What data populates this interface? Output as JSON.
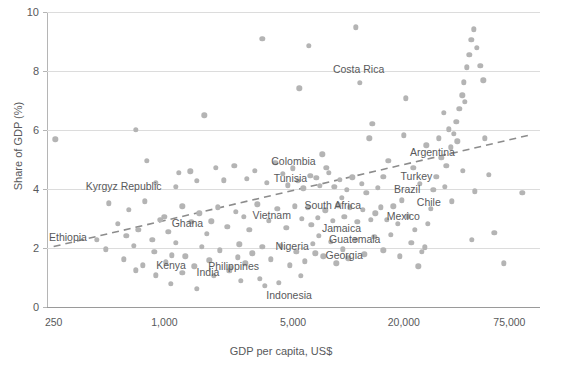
{
  "chart_data": {
    "type": "scatter",
    "title": "",
    "xlabel": "GDP per capita, US$",
    "ylabel": "Share of GDP (%)",
    "xscale": "log",
    "xlim": [
      230,
      110000
    ],
    "ylim": [
      0,
      10
    ],
    "xticks": [
      250,
      1000,
      5000,
      20000,
      75000
    ],
    "xticklabels": [
      "250",
      "1,000",
      "5,000",
      "20,000",
      "75,000"
    ],
    "yticks": [
      0,
      2,
      4,
      6,
      8,
      10
    ],
    "yticklabels": [
      "0",
      "2",
      "4",
      "6",
      "8",
      "10"
    ],
    "grid": "horizontal",
    "legend": "none",
    "point_color": "#b4b4b4",
    "trendline": {
      "style": "dashed",
      "color": "#8c8c8c",
      "x_start": 250,
      "y_start": 2.05,
      "x_end": 100000,
      "y_end": 5.85
    },
    "labeled_points": [
      {
        "name": "Costa Rica",
        "x": 11500,
        "y": 7.6
      },
      {
        "name": "Argentina",
        "x": 16500,
        "y": 4.95
      },
      {
        "name": "Turkey",
        "x": 15500,
        "y": 4.42
      },
      {
        "name": "Brazil",
        "x": 14500,
        "y": 4.05
      },
      {
        "name": "Colombia",
        "x": 7600,
        "y": 4.72
      },
      {
        "name": "Tunisia",
        "x": 6700,
        "y": 4.38
      },
      {
        "name": "South Africa",
        "x": 9200,
        "y": 3.7
      },
      {
        "name": "Chile",
        "x": 19500,
        "y": 3.62
      },
      {
        "name": "Mexico",
        "x": 14000,
        "y": 3.18
      },
      {
        "name": "Kyrgyz Republic",
        "x": 1150,
        "y": 4.08
      },
      {
        "name": "Vietnam",
        "x": 2700,
        "y": 3.05
      },
      {
        "name": "Ghana",
        "x": 1800,
        "y": 2.9
      },
      {
        "name": "Jamaica",
        "x": 6300,
        "y": 2.78
      },
      {
        "name": "Guatemala",
        "x": 6900,
        "y": 2.42
      },
      {
        "name": "Ethiopia",
        "x": 430,
        "y": 2.28
      },
      {
        "name": "Nigeria",
        "x": 3400,
        "y": 2.05
      },
      {
        "name": "Georgia",
        "x": 6600,
        "y": 1.82
      },
      {
        "name": "Kenya",
        "x": 1100,
        "y": 1.75
      },
      {
        "name": "Philippines",
        "x": 2500,
        "y": 1.68
      },
      {
        "name": "India",
        "x": 2300,
        "y": 1.32
      },
      {
        "name": "Indonesia",
        "x": 4200,
        "y": 0.82
      }
    ],
    "points": [
      {
        "x": 255,
        "y": 5.68
      },
      {
        "x": 700,
        "y": 6.0
      },
      {
        "x": 1650,
        "y": 6.5
      },
      {
        "x": 3400,
        "y": 9.1
      },
      {
        "x": 6100,
        "y": 8.85
      },
      {
        "x": 5400,
        "y": 7.42
      },
      {
        "x": 13500,
        "y": 6.22
      },
      {
        "x": 13000,
        "y": 5.72
      },
      {
        "x": 20500,
        "y": 7.08
      },
      {
        "x": 20000,
        "y": 5.82
      },
      {
        "x": 800,
        "y": 4.95
      },
      {
        "x": 7200,
        "y": 5.18
      },
      {
        "x": 11000,
        "y": 9.48
      },
      {
        "x": 900,
        "y": 4.22
      },
      {
        "x": 500,
        "y": 3.52
      },
      {
        "x": 640,
        "y": 3.3
      },
      {
        "x": 780,
        "y": 3.58
      },
      {
        "x": 1000,
        "y": 3.05
      },
      {
        "x": 1200,
        "y": 4.55
      },
      {
        "x": 1380,
        "y": 4.6
      },
      {
        "x": 1500,
        "y": 4.28
      },
      {
        "x": 1900,
        "y": 4.72
      },
      {
        "x": 2100,
        "y": 4.3
      },
      {
        "x": 2400,
        "y": 4.78
      },
      {
        "x": 2800,
        "y": 4.35
      },
      {
        "x": 3100,
        "y": 4.62
      },
      {
        "x": 3600,
        "y": 4.22
      },
      {
        "x": 4000,
        "y": 4.88
      },
      {
        "x": 4400,
        "y": 4.52
      },
      {
        "x": 4700,
        "y": 4.12
      },
      {
        "x": 5000,
        "y": 4.7
      },
      {
        "x": 5300,
        "y": 4.28
      },
      {
        "x": 5700,
        "y": 4.02
      },
      {
        "x": 6200,
        "y": 4.44
      },
      {
        "x": 7000,
        "y": 4.1
      },
      {
        "x": 7800,
        "y": 4.55
      },
      {
        "x": 8400,
        "y": 4.08
      },
      {
        "x": 9000,
        "y": 4.32
      },
      {
        "x": 9800,
        "y": 3.98
      },
      {
        "x": 10500,
        "y": 4.4
      },
      {
        "x": 11800,
        "y": 4.18
      },
      {
        "x": 12500,
        "y": 3.88
      },
      {
        "x": 560,
        "y": 2.82
      },
      {
        "x": 620,
        "y": 2.42
      },
      {
        "x": 720,
        "y": 2.62
      },
      {
        "x": 860,
        "y": 2.28
      },
      {
        "x": 950,
        "y": 2.95
      },
      {
        "x": 1050,
        "y": 2.55
      },
      {
        "x": 1250,
        "y": 3.42
      },
      {
        "x": 1400,
        "y": 2.88
      },
      {
        "x": 1550,
        "y": 3.18
      },
      {
        "x": 1700,
        "y": 2.48
      },
      {
        "x": 1950,
        "y": 3.38
      },
      {
        "x": 2200,
        "y": 2.72
      },
      {
        "x": 2450,
        "y": 3.22
      },
      {
        "x": 2900,
        "y": 2.62
      },
      {
        "x": 3200,
        "y": 3.48
      },
      {
        "x": 3700,
        "y": 2.92
      },
      {
        "x": 4100,
        "y": 3.32
      },
      {
        "x": 4600,
        "y": 2.68
      },
      {
        "x": 5100,
        "y": 3.42
      },
      {
        "x": 5600,
        "y": 2.98
      },
      {
        "x": 6000,
        "y": 3.38
      },
      {
        "x": 6800,
        "y": 3.02
      },
      {
        "x": 7500,
        "y": 3.28
      },
      {
        "x": 8200,
        "y": 2.92
      },
      {
        "x": 8800,
        "y": 3.45
      },
      {
        "x": 9500,
        "y": 3.05
      },
      {
        "x": 10200,
        "y": 3.38
      },
      {
        "x": 11200,
        "y": 2.88
      },
      {
        "x": 12000,
        "y": 3.3
      },
      {
        "x": 13200,
        "y": 2.95
      },
      {
        "x": 15000,
        "y": 3.38
      },
      {
        "x": 16200,
        "y": 2.95
      },
      {
        "x": 17500,
        "y": 3.42
      },
      {
        "x": 18500,
        "y": 2.82
      },
      {
        "x": 21000,
        "y": 3.08
      },
      {
        "x": 23000,
        "y": 2.62
      },
      {
        "x": 480,
        "y": 1.95
      },
      {
        "x": 600,
        "y": 1.62
      },
      {
        "x": 680,
        "y": 2.08
      },
      {
        "x": 760,
        "y": 1.42
      },
      {
        "x": 880,
        "y": 1.88
      },
      {
        "x": 1020,
        "y": 1.52
      },
      {
        "x": 1150,
        "y": 2.18
      },
      {
        "x": 1300,
        "y": 1.72
      },
      {
        "x": 1450,
        "y": 1.38
      },
      {
        "x": 1600,
        "y": 2.05
      },
      {
        "x": 1750,
        "y": 1.58
      },
      {
        "x": 2000,
        "y": 1.92
      },
      {
        "x": 2250,
        "y": 1.22
      },
      {
        "x": 2550,
        "y": 2.12
      },
      {
        "x": 2750,
        "y": 1.48
      },
      {
        "x": 3000,
        "y": 1.82
      },
      {
        "x": 3300,
        "y": 0.95
      },
      {
        "x": 3800,
        "y": 1.62
      },
      {
        "x": 4300,
        "y": 2.08
      },
      {
        "x": 4800,
        "y": 1.42
      },
      {
        "x": 5200,
        "y": 1.88
      },
      {
        "x": 5800,
        "y": 1.55
      },
      {
        "x": 6400,
        "y": 2.15
      },
      {
        "x": 7300,
        "y": 1.72
      },
      {
        "x": 8000,
        "y": 2.22
      },
      {
        "x": 8600,
        "y": 1.48
      },
      {
        "x": 9300,
        "y": 1.95
      },
      {
        "x": 10000,
        "y": 1.65
      },
      {
        "x": 11000,
        "y": 2.28
      },
      {
        "x": 12200,
        "y": 1.78
      },
      {
        "x": 13800,
        "y": 2.38
      },
      {
        "x": 15500,
        "y": 1.92
      },
      {
        "x": 17000,
        "y": 2.45
      },
      {
        "x": 19000,
        "y": 1.72
      },
      {
        "x": 22000,
        "y": 2.18
      },
      {
        "x": 25000,
        "y": 1.88
      },
      {
        "x": 1080,
        "y": 0.78
      },
      {
        "x": 1500,
        "y": 0.62
      },
      {
        "x": 1850,
        "y": 1.05
      },
      {
        "x": 2600,
        "y": 0.88
      },
      {
        "x": 3500,
        "y": 0.72
      },
      {
        "x": 5500,
        "y": 1.05
      },
      {
        "x": 900,
        "y": 1.08
      },
      {
        "x": 1250,
        "y": 1.15
      },
      {
        "x": 700,
        "y": 1.25
      },
      {
        "x": 30000,
        "y": 4.42
      },
      {
        "x": 32000,
        "y": 5.05
      },
      {
        "x": 34000,
        "y": 4.78
      },
      {
        "x": 36000,
        "y": 5.42
      },
      {
        "x": 37500,
        "y": 5.88
      },
      {
        "x": 38500,
        "y": 6.28
      },
      {
        "x": 40000,
        "y": 6.72
      },
      {
        "x": 41500,
        "y": 7.18
      },
      {
        "x": 42500,
        "y": 7.62
      },
      {
        "x": 44000,
        "y": 8.12
      },
      {
        "x": 45500,
        "y": 8.55
      },
      {
        "x": 46500,
        "y": 9.05
      },
      {
        "x": 48000,
        "y": 9.42
      },
      {
        "x": 50000,
        "y": 8.78
      },
      {
        "x": 52000,
        "y": 8.18
      },
      {
        "x": 54000,
        "y": 7.68
      },
      {
        "x": 43000,
        "y": 6.95
      },
      {
        "x": 39000,
        "y": 5.62
      },
      {
        "x": 35000,
        "y": 6.02
      },
      {
        "x": 33000,
        "y": 6.58
      },
      {
        "x": 31000,
        "y": 5.72
      },
      {
        "x": 29000,
        "y": 3.98
      },
      {
        "x": 28000,
        "y": 3.32
      },
      {
        "x": 27000,
        "y": 2.82
      },
      {
        "x": 33500,
        "y": 4.08
      },
      {
        "x": 36500,
        "y": 3.58
      },
      {
        "x": 42000,
        "y": 4.62
      },
      {
        "x": 48500,
        "y": 3.92
      },
      {
        "x": 55000,
        "y": 5.72
      },
      {
        "x": 58000,
        "y": 4.48
      },
      {
        "x": 62000,
        "y": 2.52
      },
      {
        "x": 70000,
        "y": 1.48
      },
      {
        "x": 88000,
        "y": 3.88
      },
      {
        "x": 24000,
        "y": 1.38
      },
      {
        "x": 26000,
        "y": 2.02
      },
      {
        "x": 47000,
        "y": 2.28
      },
      {
        "x": 26500,
        "y": 5.48
      },
      {
        "x": 24500,
        "y": 4.18
      },
      {
        "x": 22500,
        "y": 4.72
      }
    ]
  }
}
